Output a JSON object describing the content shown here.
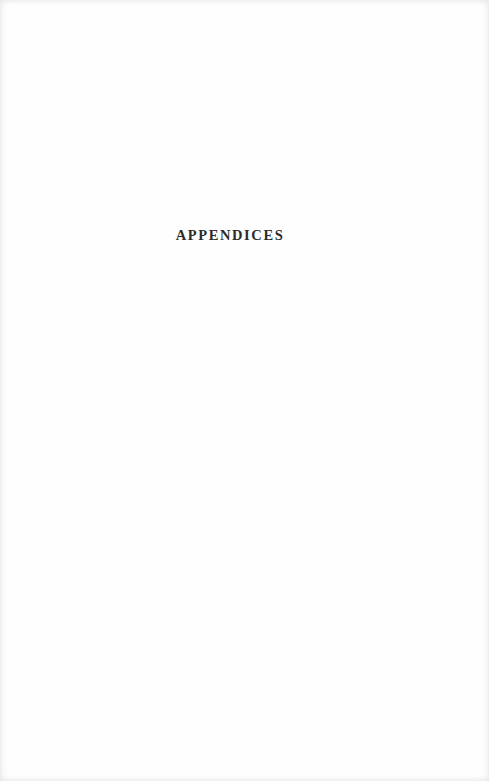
{
  "page": {
    "heading": "APPENDICES",
    "paper_color": "#fefefe",
    "ink_color": "#2b2b2b"
  }
}
